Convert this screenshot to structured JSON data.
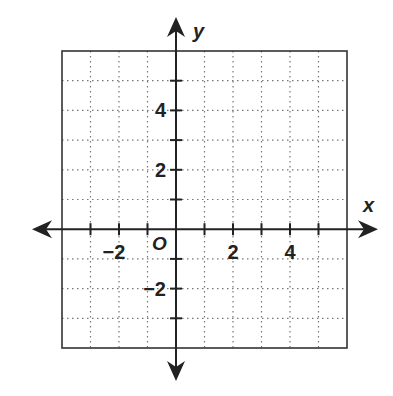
{
  "diagram": {
    "type": "coordinate-plane",
    "x_axis_label": "x",
    "y_axis_label": "y",
    "origin_label": "O",
    "x_range": [
      -4,
      6
    ],
    "y_range": [
      -4,
      6
    ],
    "grid_step": 1,
    "x_tick_labels": [
      {
        "value": -2,
        "text": "−2"
      },
      {
        "value": 2,
        "text": "2"
      },
      {
        "value": 4,
        "text": "4"
      }
    ],
    "y_tick_labels": [
      {
        "value": 4,
        "text": "4"
      },
      {
        "value": 2,
        "text": "2"
      },
      {
        "value": -2,
        "text": "−2"
      }
    ],
    "colors": {
      "axis": "#222222",
      "border": "#333333",
      "grid": "#777777",
      "background": "#ffffff"
    }
  }
}
